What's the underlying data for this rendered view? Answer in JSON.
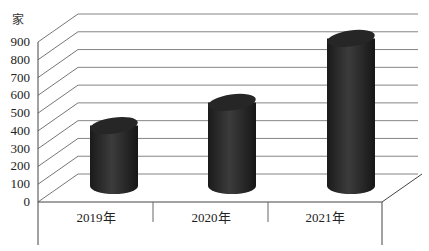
{
  "chart_data": {
    "type": "bar",
    "style": "3d-cylinder",
    "title": "",
    "xlabel": "",
    "ylabel": "家",
    "categories": [
      "2019年",
      "2020年",
      "2021年"
    ],
    "values": [
      340,
      470,
      830
    ],
    "ylim": [
      0,
      900
    ],
    "yticks": [
      0,
      100,
      200,
      300,
      400,
      500,
      600,
      700,
      800,
      900
    ],
    "grid": true,
    "legend": "none",
    "bar_color": "#2a2a2a"
  },
  "axis": {
    "unit": "家",
    "ticks": [
      "0",
      "100",
      "200",
      "300",
      "400",
      "500",
      "600",
      "700",
      "800",
      "900"
    ]
  },
  "categories": [
    "2019年",
    "2020年",
    "2021年"
  ]
}
